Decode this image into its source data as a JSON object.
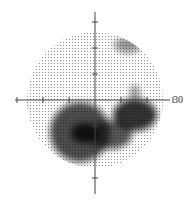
{
  "chart_data": {
    "type": "heatmap",
    "xlabel": "",
    "ylabel": "",
    "axis_label_right": "30",
    "xlim": [
      -30,
      30
    ],
    "ylim": [
      -30,
      30
    ],
    "ticks_degrees": [
      -30,
      -20,
      -10,
      10,
      20,
      30
    ],
    "grid": false,
    "center_px": [
      95,
      100
    ],
    "px_per_10deg": 26,
    "field_radius_px": 68,
    "defects": [
      {
        "name": "inferior-nasal-arcuate-left",
        "cx": 80,
        "cy": 132,
        "rx": 30,
        "ry": 30,
        "darkness": 0.75
      },
      {
        "name": "inferior-dense-center-left",
        "cx": 85,
        "cy": 133,
        "rx": 14,
        "ry": 10,
        "darkness": 0.95
      },
      {
        "name": "inferior-temporal-right",
        "cx": 135,
        "cy": 115,
        "rx": 22,
        "ry": 16,
        "darkness": 0.85
      },
      {
        "name": "inferior-center-right",
        "cx": 110,
        "cy": 135,
        "rx": 22,
        "ry": 14,
        "darkness": 0.7
      },
      {
        "name": "inferior-left-edge",
        "cx": 20,
        "cy": 108,
        "rx": 6,
        "ry": 8,
        "darkness": 0.5
      },
      {
        "name": "superior-temporal-edge",
        "cx": 128,
        "cy": 45,
        "rx": 14,
        "ry": 8,
        "darkness": 0.45
      },
      {
        "name": "right-paracentral",
        "cx": 135,
        "cy": 92,
        "rx": 5,
        "ry": 7,
        "darkness": 0.45
      }
    ]
  }
}
